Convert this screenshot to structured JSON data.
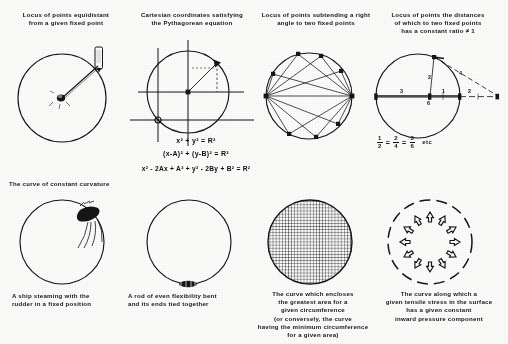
{
  "figure": {
    "background_color": "#fbfbfa",
    "ink_color": "#17171a"
  },
  "panels": [
    {
      "id": "panel-1",
      "heading": "Locus of points equidistant\nfrom a  given fixed point",
      "caption": "",
      "figure_kind": "circle-with-compass"
    },
    {
      "id": "panel-2",
      "heading": "Cartesian coordinates satisfying\nthe Pythagorean equation",
      "caption": "",
      "figure_kind": "circle-with-axes"
    },
    {
      "id": "panel-3",
      "heading": "Locus of points subtending a right\nangle to two fixed points",
      "caption": "",
      "figure_kind": "circle-with-inscribed-right-angles"
    },
    {
      "id": "panel-4",
      "heading": "Locus of points the distances\nof which to two fixed points\nhas a constant ratio ≠ 1",
      "caption": "",
      "figure_kind": "circle-of-apollonius"
    },
    {
      "id": "panel-5",
      "heading": "The curve of constant curvature",
      "caption": "A ship steaming with the\nrudder in a fixed position",
      "figure_kind": "circle-with-ship"
    },
    {
      "id": "panel-6",
      "heading": "",
      "caption": "A rod of even flexibility bent\nand its ends tied together",
      "figure_kind": "circle-with-rod-clamp"
    },
    {
      "id": "panel-7",
      "heading": "",
      "caption": "The curve which encloses\nthe greatest area for a\ngiven circumference\n(or conversely, the curve\nhaving the minimum circumference\nfor a given area)",
      "figure_kind": "circle-hatched-area"
    },
    {
      "id": "panel-8",
      "heading": "",
      "caption": "The curve along which a\ngiven tensile stress in the surface\nhas a given constant\ninward pressure component",
      "figure_kind": "circle-dashed-with-arrows"
    }
  ],
  "equations": {
    "pythagorean": [
      "x² + y² = R²",
      "(x-A)² + (y-B)² =  R²",
      "x² - 2Ax + A² + y² - 2By + B² =  R²"
    ],
    "ratio": {
      "fractions": [
        {
          "numerator": "1",
          "denominator": "2"
        },
        {
          "numerator": "2",
          "denominator": "4"
        },
        {
          "numerator": "3",
          "denominator": "6"
        }
      ],
      "separators": [
        "=",
        "="
      ],
      "trailing": "etc"
    }
  },
  "diagram_labels": {
    "apollonius": [
      "3",
      "2",
      "6",
      "1",
      "4",
      "2"
    ]
  }
}
